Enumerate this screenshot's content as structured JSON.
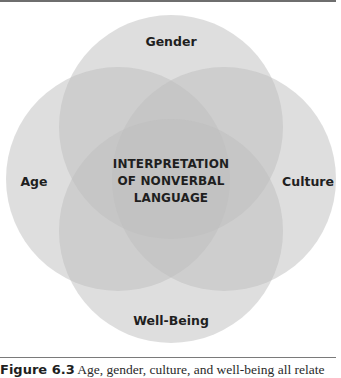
{
  "diagram": {
    "type": "venn",
    "colors": {
      "circle_fill": "#c8c8c8",
      "circle_opacity": 0.55,
      "label_color": "#1f1f1f",
      "rule_color": "#6e6e6e"
    },
    "circles": [
      {
        "id": "gender",
        "label": "Gender",
        "cx": 171,
        "cy": 127,
        "r": 112
      },
      {
        "id": "age",
        "label": "Age",
        "cx": 118,
        "cy": 179,
        "r": 112
      },
      {
        "id": "culture",
        "label": "Culture",
        "cx": 224,
        "cy": 179,
        "r": 112
      },
      {
        "id": "well-being",
        "label": "Well-Being",
        "cx": 171,
        "cy": 231,
        "r": 112
      }
    ],
    "center_label": {
      "lines": [
        "INTERPRETATION",
        "OF NONVERBAL",
        "LANGUAGE"
      ]
    }
  },
  "caption": {
    "figure_number": "Figure 6.3",
    "text": " Age, gender, culture, and well-being all relate"
  }
}
